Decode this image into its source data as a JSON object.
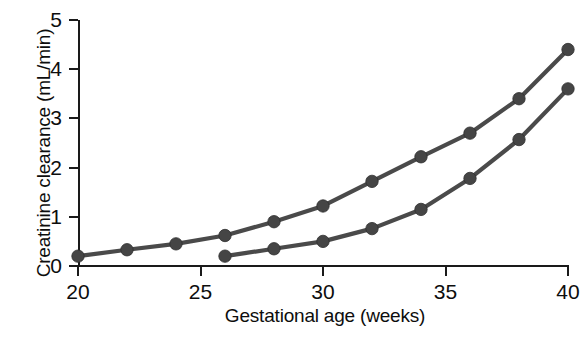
{
  "chart_data": {
    "type": "line",
    "title": "",
    "xlabel": "Gestational age (weeks)",
    "ylabel": "Creatinine clearance (mL/min)",
    "xlim": [
      20,
      40
    ],
    "ylim": [
      0,
      5
    ],
    "xticks": [
      20,
      25,
      30,
      35,
      40
    ],
    "yticks": [
      0,
      1,
      2,
      3,
      4,
      5
    ],
    "grid": false,
    "legend": "none",
    "marker": "filled-circle",
    "series": [
      {
        "name": "upper",
        "x": [
          20,
          22,
          24,
          26,
          28,
          30,
          32,
          34,
          36,
          38,
          40
        ],
        "values": [
          0.2,
          0.33,
          0.45,
          0.62,
          0.9,
          1.22,
          1.72,
          2.22,
          2.7,
          3.4,
          4.4
        ]
      },
      {
        "name": "lower",
        "x": [
          26,
          28,
          30,
          32,
          34,
          36,
          38,
          40
        ],
        "values": [
          0.2,
          0.35,
          0.5,
          0.76,
          1.15,
          1.78,
          2.57,
          3.6
        ]
      }
    ],
    "series_color": "#4a4a4a"
  }
}
